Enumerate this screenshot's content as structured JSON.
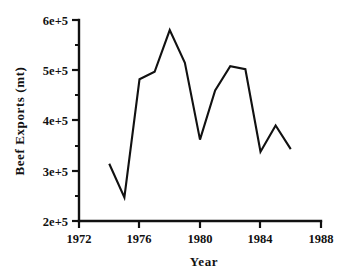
{
  "chart_data": {
    "type": "line",
    "title": "",
    "xlabel": "Year",
    "ylabel": "Beef Exports (mt)",
    "xlim": [
      1972,
      1988
    ],
    "ylim": [
      200000,
      600000
    ],
    "grid": false,
    "legend": "none",
    "x_ticks": [
      1972,
      1976,
      1980,
      1984,
      1988
    ],
    "x_tick_labels": [
      "1972",
      "1976",
      "1980",
      "1984",
      "1988"
    ],
    "y_ticks": [
      200000,
      300000,
      400000,
      500000,
      600000
    ],
    "y_tick_labels": [
      "2e+5",
      "3e+5",
      "4e+5",
      "5e+5",
      "6e+5"
    ],
    "y_minor_ticks": [
      250000,
      350000,
      450000,
      550000
    ],
    "x": [
      1974,
      1975,
      1976,
      1977,
      1978,
      1979,
      1980,
      1981,
      1982,
      1983,
      1984,
      1985,
      1986
    ],
    "values": [
      314000,
      247000,
      482000,
      497000,
      580000,
      515000,
      362000,
      460000,
      508000,
      502000,
      338000,
      390000,
      343000
    ],
    "series": [
      {
        "name": "Beef Exports",
        "color": "#111111",
        "values": [
          314000,
          247000,
          482000,
          497000,
          580000,
          515000,
          362000,
          460000,
          508000,
          502000,
          338000,
          390000,
          343000
        ]
      }
    ]
  },
  "axis": {
    "y_title": "Beef Exports  (mt)",
    "x_title": "Year"
  }
}
